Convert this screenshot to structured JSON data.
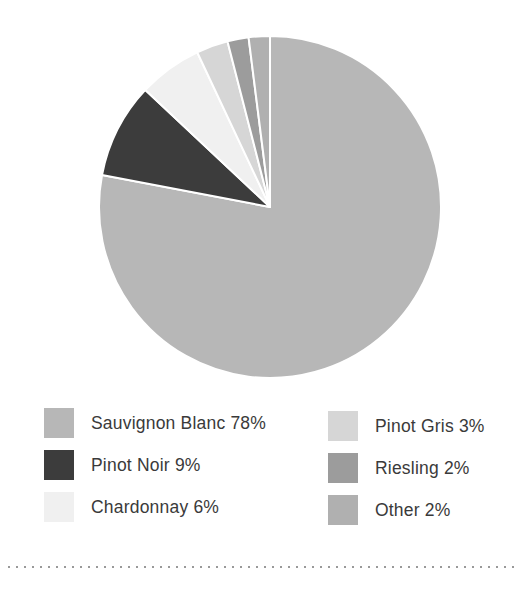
{
  "chart_data": {
    "type": "pie",
    "title": "",
    "direction": "clockwise",
    "start_angle_deg": 0,
    "legend_position": "bottom",
    "separator_color": "#ffffff",
    "slices": [
      {
        "name": "Sauvignon Blanc",
        "value": 78,
        "label": "Sauvignon Blanc 78%",
        "color": "#b7b7b7"
      },
      {
        "name": "Pinot Noir",
        "value": 9,
        "label": "Pinot Noir 9%",
        "color": "#3c3c3c"
      },
      {
        "name": "Chardonnay",
        "value": 6,
        "label": "Chardonnay 6%",
        "color": "#f0f0f0"
      },
      {
        "name": "Pinot Gris",
        "value": 3,
        "label": "Pinot Gris 3%",
        "color": "#d6d6d6"
      },
      {
        "name": "Riesling",
        "value": 2,
        "label": "Riesling 2%",
        "color": "#9c9c9c"
      },
      {
        "name": "Other",
        "value": 2,
        "label": "Other 2%",
        "color": "#b0b0b0"
      }
    ]
  },
  "style": {
    "background": "#ffffff",
    "text_color": "#3a3a3a",
    "divider_dot_color": "#999999"
  }
}
